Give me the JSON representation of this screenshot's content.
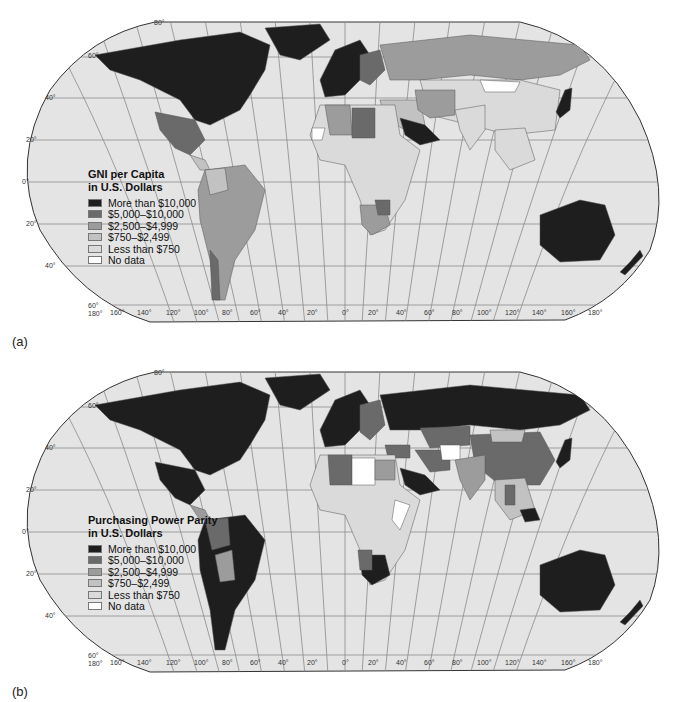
{
  "figure": {
    "panels": [
      {
        "id": "a",
        "label": "(a)",
        "legend": {
          "title_line1": "GNI per Capita",
          "title_line2": "in U.S. Dollars",
          "items": [
            {
              "label": "More than $10,000",
              "color": "#1e1e1e"
            },
            {
              "label": "$5,000–$10,000",
              "color": "#6a6a6a"
            },
            {
              "label": "$2,500–$4,999",
              "color": "#9c9c9c"
            },
            {
              "label": "$750–$2,499",
              "color": "#c2c2c2"
            },
            {
              "label": "Less than $750",
              "color": "#dadada"
            },
            {
              "label": "No data",
              "color": "#ffffff"
            }
          ]
        }
      },
      {
        "id": "b",
        "label": "(b)",
        "legend": {
          "title_line1": "Purchasing Power Parity",
          "title_line2": "in U.S. Dollars",
          "items": [
            {
              "label": "More than $10,000",
              "color": "#1e1e1e"
            },
            {
              "label": "$5,000–$10,000",
              "color": "#6a6a6a"
            },
            {
              "label": "$2,500–$4,999",
              "color": "#9c9c9c"
            },
            {
              "label": "$750–$2,499",
              "color": "#c2c2c2"
            },
            {
              "label": "Less than $750",
              "color": "#dadada"
            },
            {
              "label": "No data",
              "color": "#ffffff"
            }
          ]
        }
      }
    ],
    "graticule": {
      "latitude_labels": [
        "80°",
        "60°",
        "40°",
        "20°",
        "0°",
        "20°",
        "40°",
        "60°"
      ],
      "longitude_labels": [
        "180°",
        "160°",
        "140°",
        "120°",
        "100°",
        "80°",
        "60°",
        "40°",
        "20°",
        "0°",
        "20°",
        "40°",
        "60°",
        "80°",
        "100°",
        "120°",
        "140°",
        "160°",
        "180°"
      ]
    },
    "colors": {
      "ocean": "#e4e4e4",
      "graticule": "#8a8a8a",
      "outline": "#333333"
    }
  }
}
